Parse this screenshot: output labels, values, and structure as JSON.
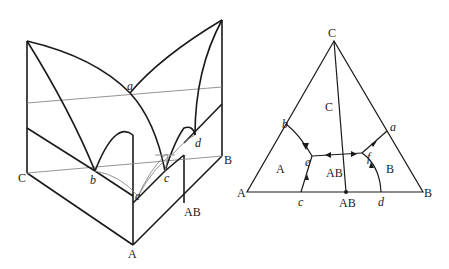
{
  "figure": {
    "left_diagram": {
      "type": "3d-ternary-phase-diagram",
      "vertex_labels": {
        "A": "A",
        "B": "B",
        "C": "C",
        "AB": "AB"
      },
      "point_labels": {
        "a": "a",
        "b": "b",
        "c": "c",
        "d": "d",
        "e": "e"
      }
    },
    "right_diagram": {
      "type": "ternary-projection",
      "vertex_labels": {
        "A": "A",
        "B": "B",
        "C": "C",
        "AB": "AB"
      },
      "point_labels": {
        "a": "a",
        "b": "b",
        "c": "c",
        "d": "d",
        "e": "e",
        "f": "f"
      },
      "region_labels": {
        "A": "A",
        "B": "B",
        "C": "C",
        "AB": "AB"
      }
    }
  }
}
